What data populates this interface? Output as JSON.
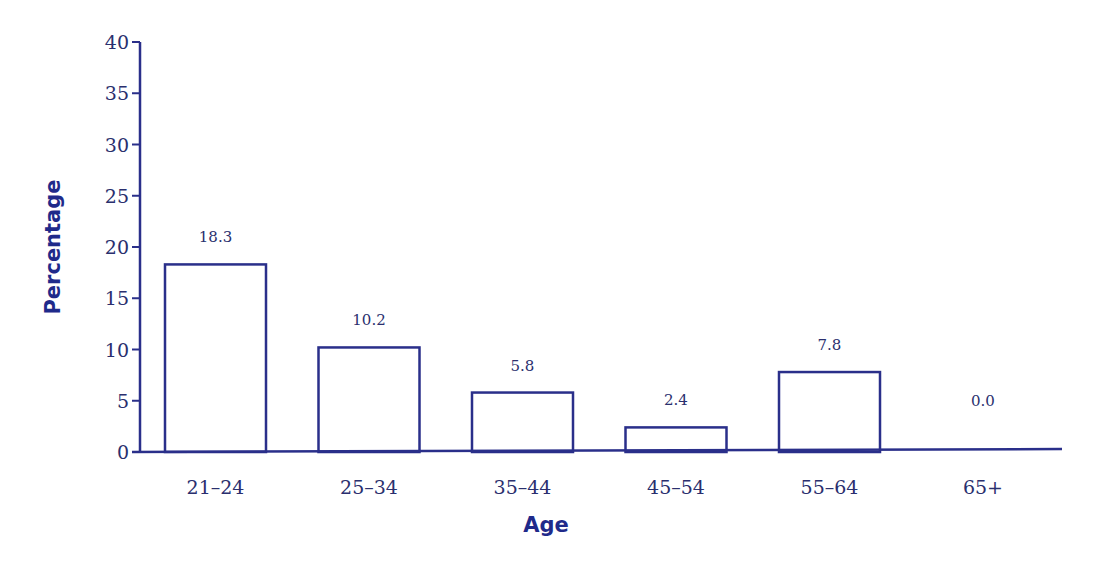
{
  "chart_data": {
    "type": "bar",
    "title": "",
    "xlabel": "Age",
    "ylabel": "Percentage",
    "categories": [
      "21–24",
      "25–34",
      "35–44",
      "45–54",
      "55–64",
      "65+"
    ],
    "values": [
      18.3,
      10.2,
      5.8,
      2.4,
      7.8,
      0.0
    ],
    "value_labels": [
      "18.3",
      "10.2",
      "5.8",
      "2.4",
      "7.8",
      "0.0"
    ],
    "ylim": [
      0,
      40
    ],
    "yticks": [
      0,
      5,
      10,
      15,
      20,
      25,
      30,
      35,
      40
    ],
    "grid": false,
    "legend": null,
    "bar_style": "outline",
    "colors": {
      "stroke": "#2a2f8a",
      "text": "#2a2f6e",
      "axis_title": "#1f2a8a",
      "fill": "#ffffff"
    }
  }
}
